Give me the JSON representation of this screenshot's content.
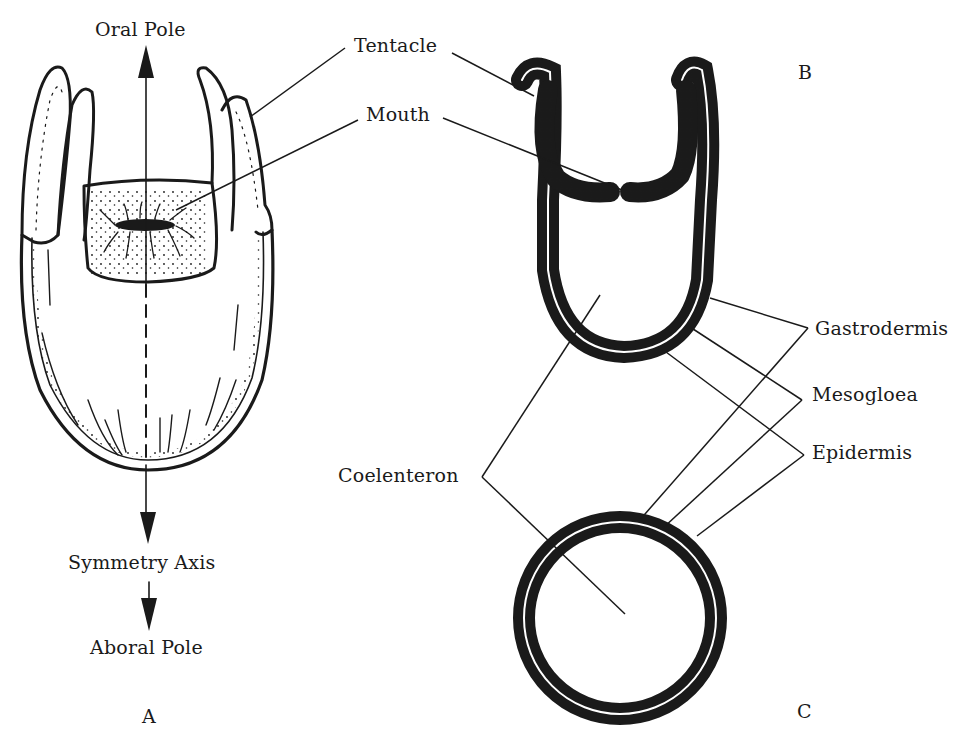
{
  "figure": {
    "type": "anatomical diagram",
    "colors": {
      "ink": "#1a1a1a",
      "background": "#ffffff"
    }
  },
  "panels": {
    "a": {
      "letter": "A"
    },
    "b": {
      "letter": "B"
    },
    "c": {
      "letter": "C"
    }
  },
  "labels": {
    "oral_pole": "Oral Pole",
    "symmetry_axis": "Symmetry Axis",
    "aboral_pole": "Aboral Pole",
    "tentacle": "Tentacle",
    "mouth": "Mouth",
    "coelenteron": "Coelenteron",
    "gastrodermis": "Gastrodermis",
    "mesogloea": "Mesogloea",
    "epidermis": "Epidermis"
  }
}
